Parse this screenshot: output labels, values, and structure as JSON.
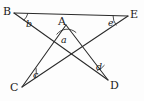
{
  "figure": {
    "kind": "star-polygon-angle-diagram",
    "background_color": "#fdfdfd",
    "stroke_color": "#2a2a2a",
    "label_color": "#1a1a1a",
    "width": 144,
    "height": 101
  },
  "vertices": [
    {
      "id": "B",
      "label": "B",
      "x": 14,
      "y": 13,
      "label_x": 3,
      "label_y": 6,
      "position": "top-left"
    },
    {
      "id": "A",
      "label": "A",
      "x": 66,
      "y": 25,
      "label_x": 58,
      "label_y": 16,
      "position": "top-center"
    },
    {
      "id": "E",
      "label": "E",
      "x": 128,
      "y": 16,
      "label_x": 130,
      "label_y": 9,
      "position": "top-right"
    },
    {
      "id": "C",
      "label": "C",
      "x": 22,
      "y": 87,
      "label_x": 10,
      "label_y": 82,
      "position": "bottom-left"
    },
    {
      "id": "D",
      "label": "D",
      "x": 108,
      "y": 80,
      "label_x": 110,
      "label_y": 80,
      "position": "bottom-right"
    }
  ],
  "edges": [
    {
      "id": "B-E",
      "from": "B",
      "to": "E"
    },
    {
      "id": "B-D",
      "from": "B",
      "to": "D"
    },
    {
      "id": "A-C",
      "from": "A",
      "to": "C"
    },
    {
      "id": "A-D",
      "from": "A",
      "to": "D"
    },
    {
      "id": "C-E",
      "from": "C",
      "to": "E"
    }
  ],
  "angles": [
    {
      "id": "a",
      "label": "a",
      "vertex": "A",
      "label_x": 61,
      "label_y": 35,
      "arc_radius": 13
    },
    {
      "id": "b",
      "label": "b",
      "vertex": "B",
      "label_x": 26,
      "label_y": 19,
      "arc_radius": 14
    },
    {
      "id": "c",
      "label": "c",
      "vertex": "C",
      "label_x": 33,
      "label_y": 70,
      "arc_radius": 16
    },
    {
      "id": "d",
      "label": "d",
      "vertex": "D",
      "label_x": 96,
      "label_y": 62,
      "arc_radius": 15
    },
    {
      "id": "e",
      "label": "e",
      "vertex": "E",
      "label_x": 108,
      "label_y": 18,
      "arc_radius": 15
    }
  ]
}
